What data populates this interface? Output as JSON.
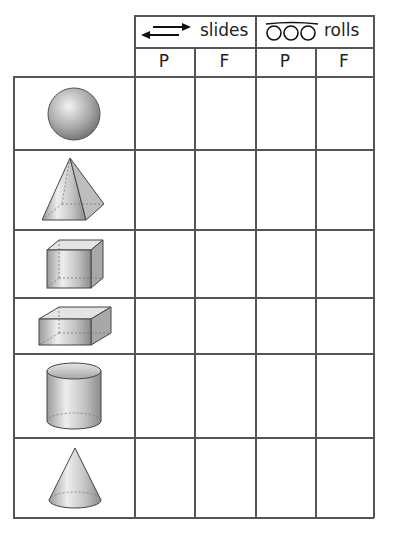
{
  "table": {
    "header": {
      "groups": [
        {
          "label": "slides",
          "icon": "double-arrow-icon"
        },
        {
          "label": "rolls",
          "icon": "loops-icon"
        }
      ],
      "subcolumns": [
        "P",
        "F",
        "P",
        "F"
      ]
    },
    "rows": [
      {
        "shape": "sphere",
        "cells": [
          "",
          "",
          "",
          ""
        ]
      },
      {
        "shape": "pyramid",
        "cells": [
          "",
          "",
          "",
          ""
        ]
      },
      {
        "shape": "cube",
        "cells": [
          "",
          "",
          "",
          ""
        ]
      },
      {
        "shape": "cuboid",
        "cells": [
          "",
          "",
          "",
          ""
        ]
      },
      {
        "shape": "cylinder",
        "cells": [
          "",
          "",
          "",
          ""
        ]
      },
      {
        "shape": "cone",
        "cells": [
          "",
          "",
          "",
          ""
        ]
      }
    ]
  },
  "colors": {
    "grid": "#555555",
    "shape_fill": "#bdbdbd",
    "shape_stroke": "#444444"
  }
}
